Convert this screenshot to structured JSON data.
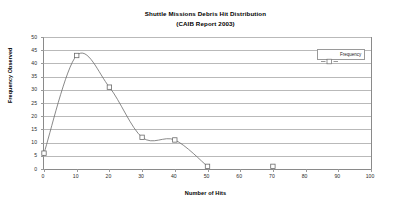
{
  "chart_data": {
    "type": "line",
    "title": "Shuttle Missions Debris Hit Distribution",
    "subtitle": "(CAIB Report 2003)",
    "xlabel": "Number of Hits",
    "ylabel": "Frequency Observed",
    "xlim": [
      0,
      100
    ],
    "ylim": [
      0,
      50
    ],
    "xticks": [
      0,
      10,
      20,
      30,
      40,
      50,
      60,
      70,
      80,
      90,
      100
    ],
    "yticks": [
      0,
      5,
      10,
      15,
      20,
      25,
      30,
      35,
      40,
      45,
      50
    ],
    "grid": "horizontal",
    "legend_position": "top-right-inside",
    "series": [
      {
        "name": "Frequency",
        "marker": "open-square",
        "line_style": "solid-smooth",
        "color": "#6b6b6b",
        "x": [
          0,
          10,
          20,
          30,
          40,
          50,
          70
        ],
        "values": [
          6,
          43,
          31,
          12,
          11,
          1,
          1
        ],
        "connected_through": [
          0,
          10,
          20,
          30,
          40,
          50
        ],
        "isolated_points": [
          70
        ]
      }
    ]
  },
  "legend": {
    "entries": [
      {
        "label": "Frequency",
        "marker": "open-square-with-dashed-line",
        "color": "#6b6b6b"
      }
    ]
  },
  "colors": {
    "axis": "#8a8a8a",
    "gridline": "#b9b9b9",
    "series": "#6b6b6b",
    "text": "#000000",
    "background": "#ffffff"
  }
}
